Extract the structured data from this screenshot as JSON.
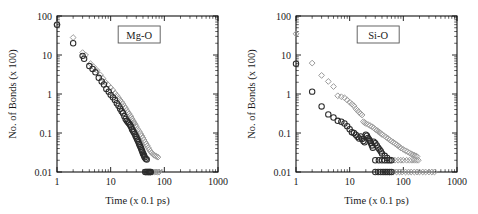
{
  "figure": {
    "background": "#ffffff",
    "panel_count": 2,
    "marker_colors": {
      "circle": "#2b2b2b",
      "diamond": "#9a9a9a"
    }
  },
  "chart_data": [
    {
      "type": "scatter",
      "title": "Mg-O",
      "xlabel": "Time (x 0.1 ps)",
      "ylabel": "No. of Bonds (x 100)",
      "xscale": "log",
      "yscale": "log",
      "xlim": [
        1,
        1000
      ],
      "ylim": [
        0.01,
        100
      ],
      "xticks": [
        1,
        10,
        100,
        1000
      ],
      "xticklabels": [
        "1",
        "10",
        "100",
        "1000"
      ],
      "yticks": [
        0.01,
        0.1,
        1,
        10,
        100
      ],
      "yticklabels": [
        "0.01",
        "0.1",
        "1",
        "10",
        "100"
      ],
      "grid": false,
      "legend": "none",
      "series": [
        {
          "name": "circle-series",
          "marker": "circle",
          "color": "#2b2b2b",
          "points": [
            [
              1.0,
              60
            ],
            [
              2.0,
              20
            ],
            [
              3.0,
              9.5
            ],
            [
              3.2,
              8.0
            ],
            [
              4.0,
              5.2
            ],
            [
              4.6,
              4.4
            ],
            [
              5.2,
              3.6
            ],
            [
              6.0,
              2.6
            ],
            [
              6.8,
              2.1
            ],
            [
              7.5,
              1.75
            ],
            [
              8.3,
              1.35
            ],
            [
              9.2,
              1.15
            ],
            [
              10.0,
              0.95
            ],
            [
              11.0,
              0.82
            ],
            [
              12.0,
              0.7
            ],
            [
              13.0,
              0.58
            ],
            [
              14.0,
              0.5
            ],
            [
              15.0,
              0.42
            ],
            [
              16.0,
              0.36
            ],
            [
              17.0,
              0.32
            ],
            [
              18.0,
              0.27
            ],
            [
              19.0,
              0.23
            ],
            [
              20.0,
              0.205
            ],
            [
              21.0,
              0.19
            ],
            [
              22.0,
              0.175
            ],
            [
              23.0,
              0.16
            ],
            [
              24.0,
              0.145
            ],
            [
              25.0,
              0.125
            ],
            [
              26.0,
              0.115
            ],
            [
              27.0,
              0.105
            ],
            [
              28.0,
              0.095
            ],
            [
              29.0,
              0.085
            ],
            [
              30.0,
              0.078
            ],
            [
              31.0,
              0.07
            ],
            [
              32.0,
              0.064
            ],
            [
              33.0,
              0.058
            ],
            [
              34.0,
              0.052
            ],
            [
              35.0,
              0.048
            ],
            [
              36.0,
              0.044
            ],
            [
              37.0,
              0.04
            ],
            [
              38.0,
              0.036
            ],
            [
              39.0,
              0.033
            ],
            [
              40.0,
              0.03
            ],
            [
              41.0,
              0.028
            ],
            [
              42.0,
              0.026
            ],
            [
              43.0,
              0.024
            ],
            [
              45.0,
              0.022
            ],
            [
              47.0,
              0.021
            ],
            [
              44.0,
              0.01
            ],
            [
              46.0,
              0.01
            ],
            [
              48.0,
              0.01
            ],
            [
              50.0,
              0.01
            ],
            [
              52.0,
              0.01
            ],
            [
              54.0,
              0.01
            ],
            [
              56.0,
              0.01
            ]
          ]
        },
        {
          "name": "diamond-series",
          "marker": "diamond",
          "color": "#9a9a9a",
          "points": [
            [
              1.0,
              60
            ],
            [
              2.0,
              28
            ],
            [
              3.0,
              11.5
            ],
            [
              3.4,
              10.0
            ],
            [
              4.2,
              6.0
            ],
            [
              4.8,
              5.0
            ],
            [
              5.6,
              4.0
            ],
            [
              6.4,
              3.1
            ],
            [
              7.2,
              2.5
            ],
            [
              8.0,
              2.0
            ],
            [
              9.0,
              1.7
            ],
            [
              10.0,
              1.45
            ],
            [
              11.0,
              1.25
            ],
            [
              12.0,
              1.05
            ],
            [
              13.0,
              0.92
            ],
            [
              14.0,
              0.8
            ],
            [
              15.0,
              0.7
            ],
            [
              16.0,
              0.62
            ],
            [
              17.0,
              0.55
            ],
            [
              18.0,
              0.48
            ],
            [
              19.0,
              0.43
            ],
            [
              20.0,
              0.38
            ],
            [
              21.0,
              0.34
            ],
            [
              22.0,
              0.31
            ],
            [
              23.0,
              0.28
            ],
            [
              24.0,
              0.255
            ],
            [
              25.0,
              0.23
            ],
            [
              26.0,
              0.21
            ],
            [
              27.0,
              0.19
            ],
            [
              28.0,
              0.175
            ],
            [
              29.0,
              0.16
            ],
            [
              30.0,
              0.145
            ],
            [
              32.0,
              0.125
            ],
            [
              34.0,
              0.11
            ],
            [
              36.0,
              0.096
            ],
            [
              38.0,
              0.085
            ],
            [
              40.0,
              0.075
            ],
            [
              42.0,
              0.066
            ],
            [
              44.0,
              0.058
            ],
            [
              46.0,
              0.052
            ],
            [
              48.0,
              0.047
            ],
            [
              50.0,
              0.042
            ],
            [
              52.0,
              0.038
            ],
            [
              55.0,
              0.034
            ],
            [
              58.0,
              0.031
            ],
            [
              61.0,
              0.029
            ],
            [
              64.0,
              0.027
            ],
            [
              68.0,
              0.026
            ],
            [
              72.0,
              0.025
            ],
            [
              76.0,
              0.024
            ],
            [
              45.0,
              0.01
            ],
            [
              50.0,
              0.01
            ],
            [
              55.0,
              0.01
            ],
            [
              60.0,
              0.01
            ],
            [
              65.0,
              0.01
            ],
            [
              70.0,
              0.01
            ],
            [
              75.0,
              0.01
            ],
            [
              80.0,
              0.01
            ]
          ]
        }
      ]
    },
    {
      "type": "scatter",
      "title": "Si-O",
      "xlabel": "Time (x 0.1 ps)",
      "ylabel": "No. of Bonds (x 100)",
      "xscale": "log",
      "yscale": "log",
      "xlim": [
        1,
        1000
      ],
      "ylim": [
        0.01,
        100
      ],
      "xticks": [
        1,
        10,
        100,
        1000
      ],
      "xticklabels": [
        "1",
        "10",
        "100",
        "1000"
      ],
      "yticks": [
        0.01,
        0.1,
        1,
        10,
        100
      ],
      "yticklabels": [
        "0.01",
        "0.1",
        "1",
        "10",
        "100"
      ],
      "grid": false,
      "legend": "none",
      "series": [
        {
          "name": "circle-series",
          "marker": "circle",
          "color": "#2b2b2b",
          "points": [
            [
              1.0,
              6.0
            ],
            [
              2.0,
              1.15
            ],
            [
              3.0,
              0.48
            ],
            [
              4.0,
              0.3
            ],
            [
              5.0,
              0.25
            ],
            [
              6.0,
              0.205
            ],
            [
              7.0,
              0.195
            ],
            [
              8.0,
              0.175
            ],
            [
              9.0,
              0.15
            ],
            [
              10.0,
              0.125
            ],
            [
              11.0,
              0.105
            ],
            [
              12.0,
              0.1
            ],
            [
              13.0,
              0.09
            ],
            [
              14.0,
              0.08
            ],
            [
              15.0,
              0.072
            ],
            [
              16.0,
              0.082
            ],
            [
              17.0,
              0.07
            ],
            [
              18.0,
              0.062
            ],
            [
              19.0,
              0.058
            ],
            [
              20.0,
              0.09
            ],
            [
              21.0,
              0.085
            ],
            [
              22.0,
              0.075
            ],
            [
              23.0,
              0.068
            ],
            [
              24.0,
              0.062
            ],
            [
              25.0,
              0.055
            ],
            [
              26.0,
              0.048
            ],
            [
              27.0,
              0.042
            ],
            [
              28.0,
              0.06
            ],
            [
              30.0,
              0.055
            ],
            [
              32.0,
              0.048
            ],
            [
              34.0,
              0.042
            ],
            [
              36.0,
              0.038
            ],
            [
              38.0,
              0.034
            ],
            [
              40.0,
              0.03
            ],
            [
              45.0,
              0.026
            ],
            [
              50.0,
              0.023
            ],
            [
              30.0,
              0.02
            ],
            [
              35.0,
              0.02
            ],
            [
              40.0,
              0.02
            ],
            [
              45.0,
              0.02
            ],
            [
              50.0,
              0.02
            ],
            [
              55.0,
              0.02
            ],
            [
              60.0,
              0.02
            ],
            [
              30.0,
              0.01
            ],
            [
              34.0,
              0.01
            ],
            [
              38.0,
              0.01
            ],
            [
              42.0,
              0.01
            ],
            [
              46.0,
              0.01
            ],
            [
              50.0,
              0.01
            ],
            [
              55.0,
              0.01
            ],
            [
              60.0,
              0.01
            ]
          ]
        },
        {
          "name": "diamond-series",
          "marker": "diamond",
          "color": "#9a9a9a",
          "points": [
            [
              1.0,
              35
            ],
            [
              2.0,
              6.2
            ],
            [
              3.0,
              3.0
            ],
            [
              4.0,
              2.1
            ],
            [
              5.0,
              1.55
            ],
            [
              6.0,
              0.9
            ],
            [
              7.0,
              0.85
            ],
            [
              8.0,
              0.8
            ],
            [
              9.0,
              0.7
            ],
            [
              10.0,
              0.62
            ],
            [
              11.0,
              0.55
            ],
            [
              12.0,
              0.5
            ],
            [
              13.0,
              0.42
            ],
            [
              14.0,
              0.38
            ],
            [
              15.0,
              0.34
            ],
            [
              16.0,
              0.31
            ],
            [
              17.0,
              0.29
            ],
            [
              18.0,
              0.195
            ],
            [
              19.0,
              0.185
            ],
            [
              20.0,
              0.175
            ],
            [
              22.0,
              0.165
            ],
            [
              24.0,
              0.155
            ],
            [
              26.0,
              0.145
            ],
            [
              28.0,
              0.135
            ],
            [
              30.0,
              0.125
            ],
            [
              32.0,
              0.118
            ],
            [
              34.0,
              0.11
            ],
            [
              36.0,
              0.105
            ],
            [
              38.0,
              0.098
            ],
            [
              40.0,
              0.092
            ],
            [
              44.0,
              0.085
            ],
            [
              48.0,
              0.078
            ],
            [
              52.0,
              0.072
            ],
            [
              56.0,
              0.066
            ],
            [
              60.0,
              0.062
            ],
            [
              65.0,
              0.058
            ],
            [
              70.0,
              0.054
            ],
            [
              75.0,
              0.05
            ],
            [
              80.0,
              0.047
            ],
            [
              85.0,
              0.044
            ],
            [
              90.0,
              0.041
            ],
            [
              100.0,
              0.038
            ],
            [
              110.0,
              0.035
            ],
            [
              120.0,
              0.033
            ],
            [
              130.0,
              0.031
            ],
            [
              140.0,
              0.029
            ],
            [
              150.0,
              0.028
            ],
            [
              160.0,
              0.027
            ],
            [
              170.0,
              0.026
            ],
            [
              180.0,
              0.025
            ],
            [
              60.0,
              0.02
            ],
            [
              70.0,
              0.02
            ],
            [
              80.0,
              0.02
            ],
            [
              90.0,
              0.02
            ],
            [
              100.0,
              0.02
            ],
            [
              115.0,
              0.02
            ],
            [
              130.0,
              0.02
            ],
            [
              145.0,
              0.02
            ],
            [
              160.0,
              0.02
            ],
            [
              175.0,
              0.02
            ],
            [
              190.0,
              0.02
            ],
            [
              55.0,
              0.01
            ],
            [
              65.0,
              0.01
            ],
            [
              75.0,
              0.01
            ],
            [
              85.0,
              0.01
            ],
            [
              95.0,
              0.01
            ],
            [
              110.0,
              0.01
            ],
            [
              125.0,
              0.01
            ],
            [
              140.0,
              0.01
            ],
            [
              160.0,
              0.01
            ],
            [
              180.0,
              0.01
            ],
            [
              200.0,
              0.01
            ],
            [
              230.0,
              0.01
            ],
            [
              260.0,
              0.01
            ],
            [
              300.0,
              0.01
            ],
            [
              340.0,
              0.01
            ],
            [
              380.0,
              0.01
            ]
          ]
        }
      ]
    }
  ]
}
